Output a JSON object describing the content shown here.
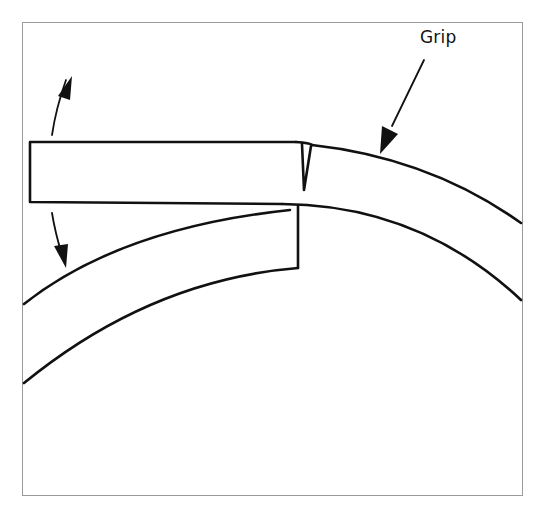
{
  "figure": {
    "type": "technical-illustration",
    "labels": {
      "grip": "Grip"
    },
    "elements": [
      {
        "name": "upper-ring-segment",
        "description": "Ring section lifted straight, held flat; upper band curving right with a split end gap"
      },
      {
        "name": "lower-ring-arc",
        "description": "Lower curved ring band continuing to the left"
      },
      {
        "name": "twist-arrows",
        "description": "Curved double arrow at left showing up/down twisting motion"
      },
      {
        "name": "grip-arrow",
        "description": "Arrow pointing to grip location on the upper curved band"
      }
    ],
    "colors": {
      "line": "#111111",
      "frame": "#9a9a9a",
      "background": "#ffffff"
    }
  }
}
